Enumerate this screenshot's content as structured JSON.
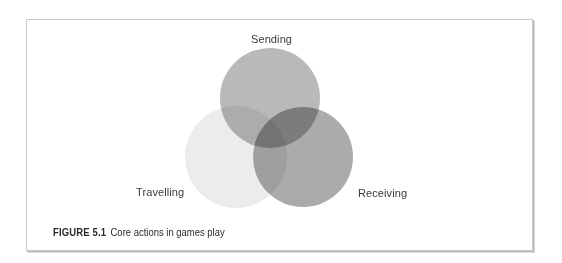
{
  "figure": {
    "number_label": "FIGURE 5.1",
    "caption": "Core actions in games play"
  },
  "diagram": {
    "type": "venn",
    "sets": [
      {
        "label": "Sending",
        "position": "top",
        "cx": 270,
        "cy": 98,
        "r": 50,
        "fill": "#9e9e9e",
        "opacity": 0.72
      },
      {
        "label": "Travelling",
        "position": "bottom-left",
        "cx": 236,
        "cy": 157,
        "r": 51,
        "fill": "#d9d9d9",
        "opacity": 0.5
      },
      {
        "label": "Receiving",
        "position": "bottom-right",
        "cx": 303,
        "cy": 157,
        "r": 50,
        "fill": "#8a8a8a",
        "opacity": 0.72
      }
    ]
  },
  "colors": {
    "frame_border": "#c8c8c8",
    "label_text": "#3a3a3a",
    "background": "#ffffff"
  }
}
